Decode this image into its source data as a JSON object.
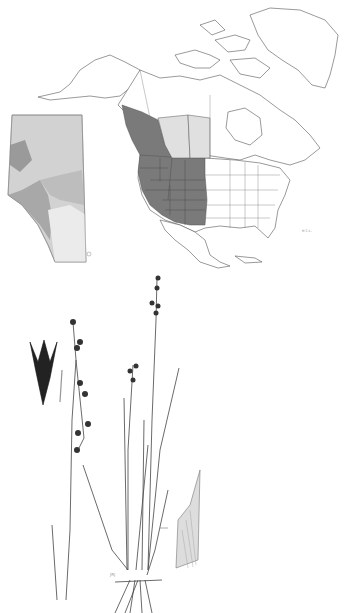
{
  "figure": {
    "type": "species distribution map with botanical illustration",
    "map": {
      "region": "North America",
      "range_color": "#7a7a7a",
      "peripheral_color": "#e0e0e0",
      "outline_color": "#555555",
      "inset": {
        "region": "Alberta",
        "shades": [
          "#9a9a9a",
          "#b8b8b8",
          "#d2d2d2",
          "#e8e8e8"
        ]
      },
      "scale_label": "e.t.c."
    },
    "illustration": {
      "subject": "rush plant (Juncus) with flowering heads, floral detail and sheath detail",
      "signature": "JRJ"
    }
  }
}
